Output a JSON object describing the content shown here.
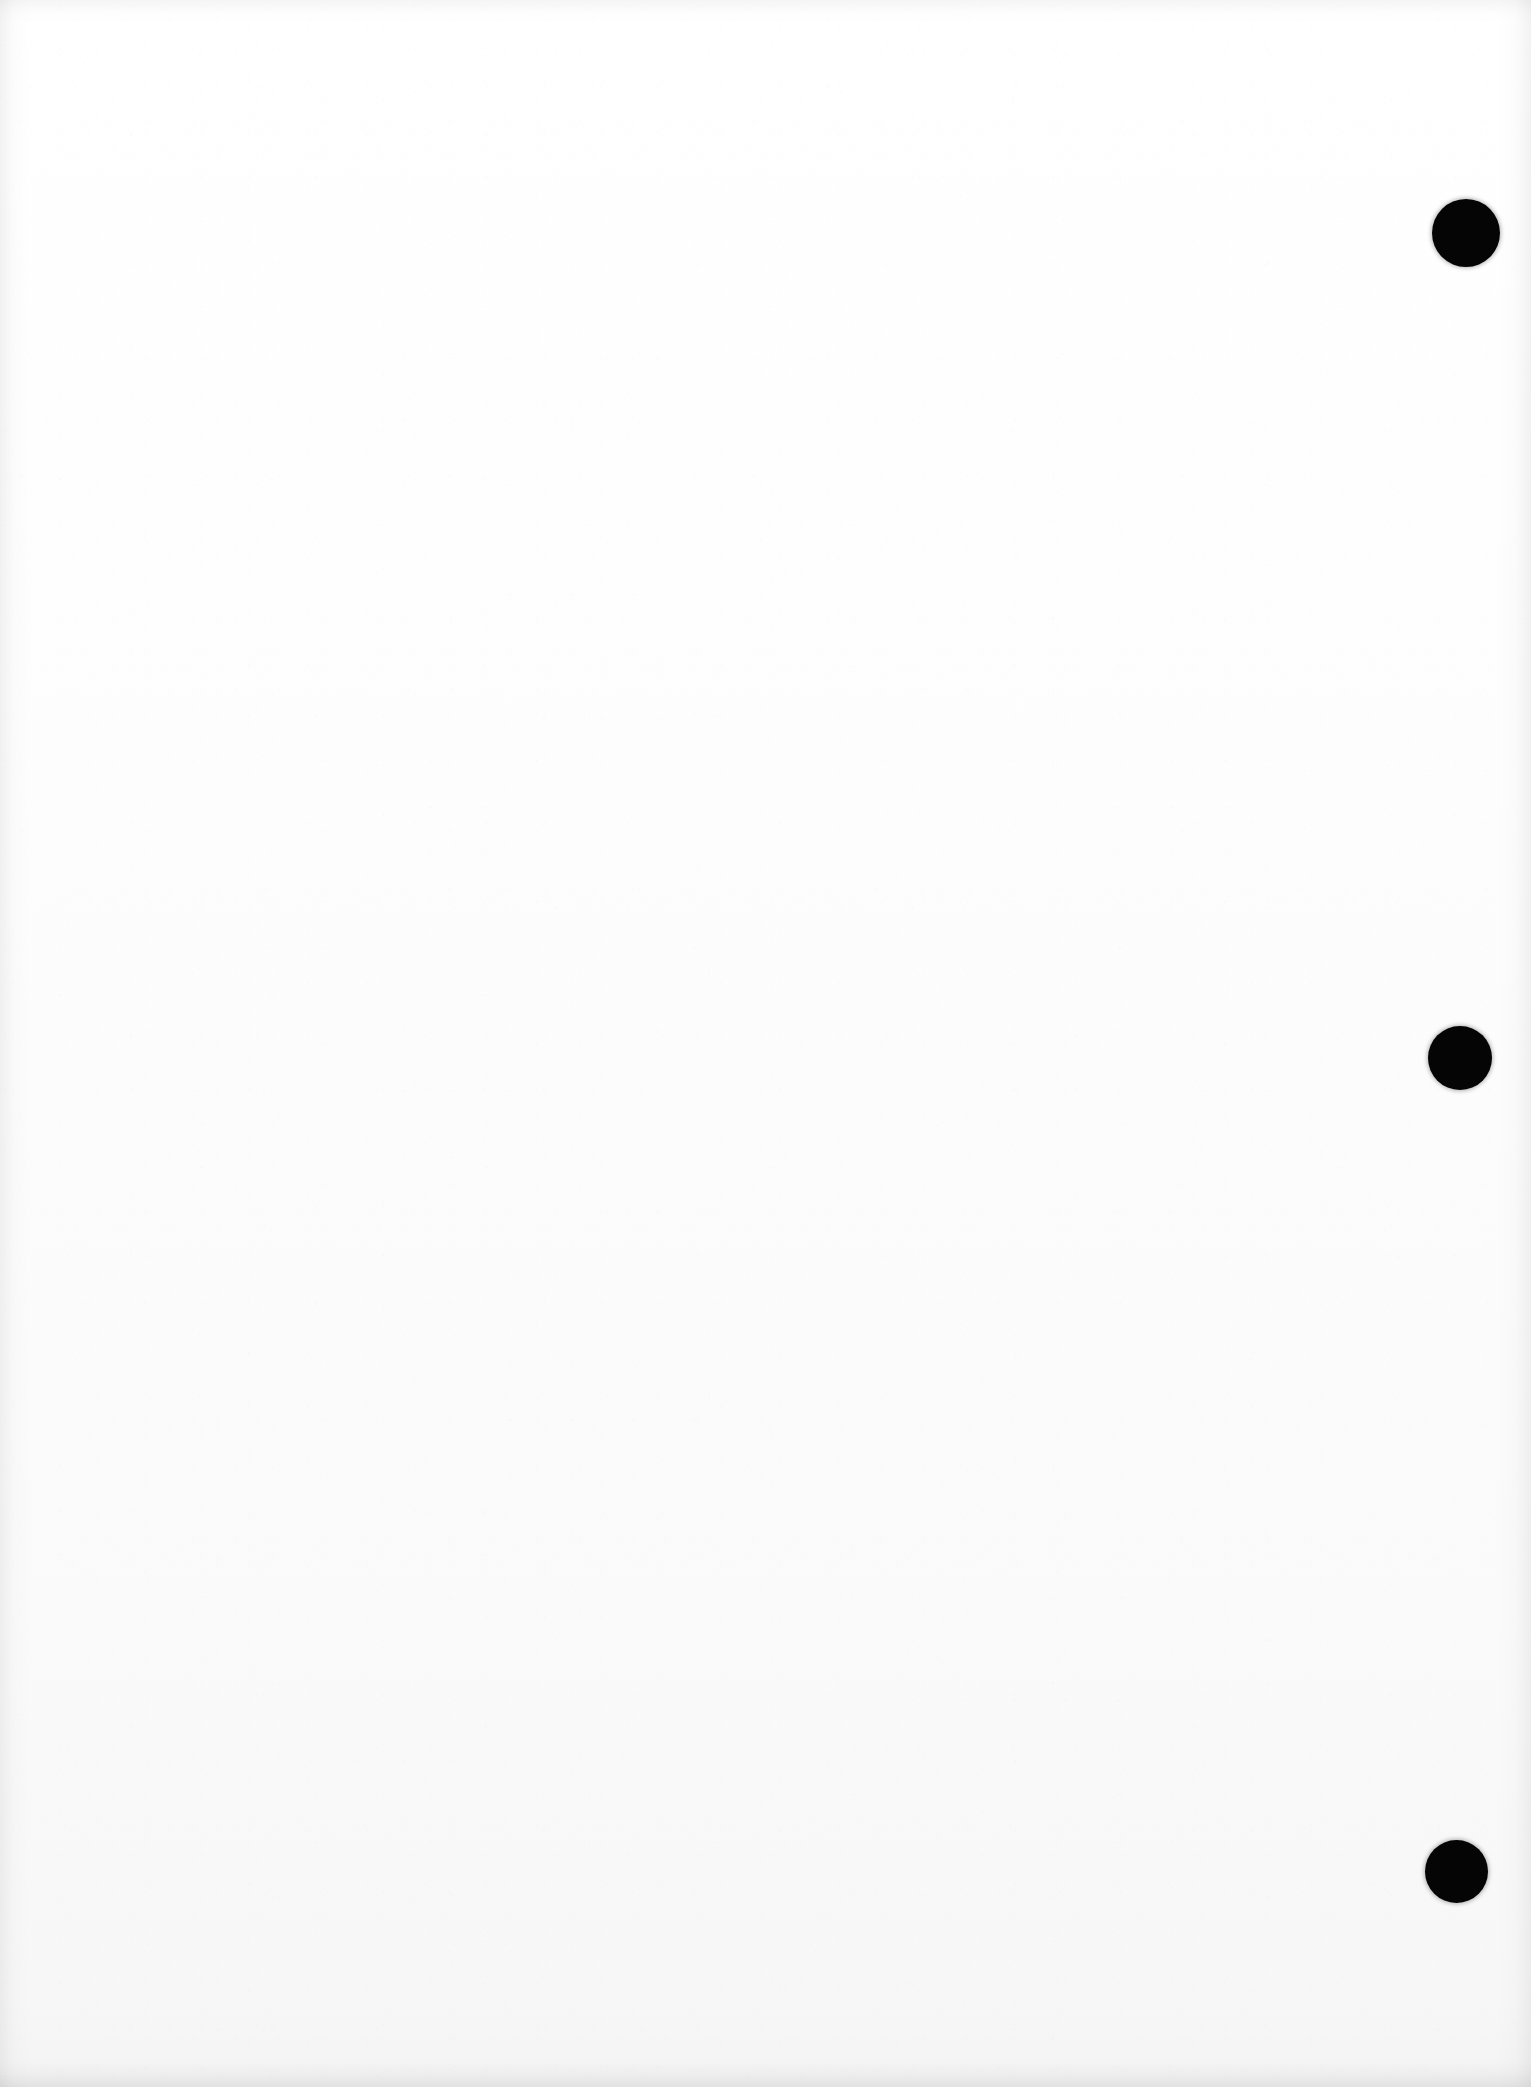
{
  "document": {
    "kind": "scanned-page",
    "title": "Scanned blank page",
    "page_width": 1531,
    "page_height": 2087,
    "page_color": "#fdfdfd",
    "ink_color": "#050505",
    "body_text": "",
    "visible_text_content": "",
    "notes": "Blank scanned sheet; no text, headings, figures or page numbers are rendered."
  },
  "marks": {
    "label": "right-margin punch marks",
    "color": "#050505",
    "count": 3,
    "items": [
      {
        "name": "punch-mark-top",
        "cx": 1466,
        "cy": 233,
        "diameter": 68
      },
      {
        "name": "punch-mark-middle",
        "cx": 1460,
        "cy": 1058,
        "diameter": 64
      },
      {
        "name": "punch-mark-bottom",
        "cx": 1456,
        "cy": 1871,
        "diameter": 63
      }
    ]
  },
  "edges": {
    "left_shadow": "#000000",
    "right_shadow": "#000000",
    "top_shadow": "#000000",
    "bottom_shadow": "#000000"
  }
}
